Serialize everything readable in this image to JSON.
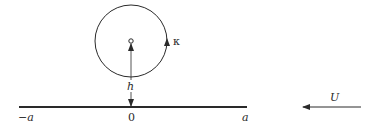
{
  "diagram": {
    "vortex": {
      "center": [
        131,
        41
      ],
      "radius": 36,
      "strength_label": "κ",
      "circulation_arrow_direction": "counterclockwise-up-on-right"
    },
    "height_marker": {
      "label": "h",
      "from_y": 41,
      "to_y": 107
    },
    "plate": {
      "y": 107,
      "x_start": 19,
      "x_end": 247,
      "labels": {
        "left": "−a",
        "center": "0",
        "right": "a"
      }
    },
    "stream": {
      "label": "U",
      "arrow_from_x": 361,
      "arrow_to_x": 302,
      "y": 107,
      "direction": "left"
    },
    "colors": {
      "stroke": "#2a2a2a",
      "background": "#ffffff"
    }
  }
}
